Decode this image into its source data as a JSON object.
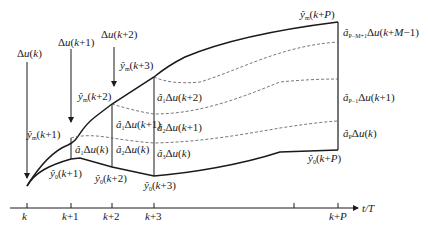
{
  "diagram": {
    "type": "model-predictive-control-prediction-horizon",
    "axis": {
      "label": "t/T",
      "ticks": [
        {
          "label": "k",
          "x": 27
        },
        {
          "label": "k+1",
          "x": 71
        },
        {
          "label": "k+2",
          "x": 112
        },
        {
          "label": "k+3",
          "x": 154
        },
        {
          "label": "",
          "x": 294
        },
        {
          "label": "k+P",
          "x": 338
        }
      ]
    },
    "inputs": [
      {
        "label": "Δu(k)",
        "arrow_x": 27
      },
      {
        "label": "Δu(k+1)",
        "arrow_x": 71
      },
      {
        "label": "Δu(k+2)",
        "arrow_x": 114
      }
    ],
    "predicted_labels": {
      "ym_k1": "ŷm(k+1)",
      "ym_k2": "ŷm(k+2)",
      "ym_k3": "ŷm(k+3)",
      "ym_kP": "ŷm(k+P)",
      "y0_k1": "ŷ0(k+1)",
      "y0_k2": "ŷ0(k+2)",
      "y0_k3": "ŷ0(k+3)",
      "y0_kP": "ŷ0(k+P)"
    },
    "increments": {
      "a1_du_k_at_k1": "â1Δu(k)",
      "a1_du_k1_at_k2": "â1Δu(k+1)",
      "a2_du_k_at_k2": "â2Δu(k)",
      "a1_du_k2_at_k3": "â1Δu(k+2)",
      "a2_du_k1_at_k3": "â2Δu(k+1)",
      "a3_du_k_at_k3": "â3Δu(k)",
      "aPM1_du_kM1_at_kP": "âP−M+1Δu(k+M−1)",
      "aP1_du_k1_at_kP": "âP−1Δu(k+1)",
      "aP_du_k_at_kP": "âPΔu(k)"
    },
    "colors": {
      "line": "#1a1a1a",
      "dashed": "#555555",
      "background": "#ffffff"
    }
  }
}
